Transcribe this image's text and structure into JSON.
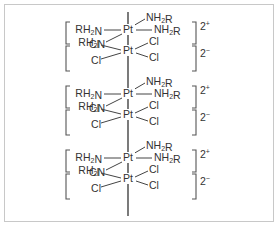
{
  "diagram": {
    "repeat_units": 3,
    "cation": {
      "metal": "Pt",
      "ligands": [
        "RH2N",
        "RH2N",
        "NH2R",
        "NH2R"
      ],
      "charge": "2+",
      "charge_digit": "2",
      "charge_sign": "+"
    },
    "anion": {
      "metal": "Pt",
      "ligands": [
        "Cl",
        "Cl",
        "Cl",
        "Cl"
      ],
      "charge": "2−",
      "charge_digit": "2",
      "charge_sign": "−"
    },
    "colors": {
      "line": "#444444",
      "text": "#333333",
      "frame": "#c8c8c8"
    }
  }
}
